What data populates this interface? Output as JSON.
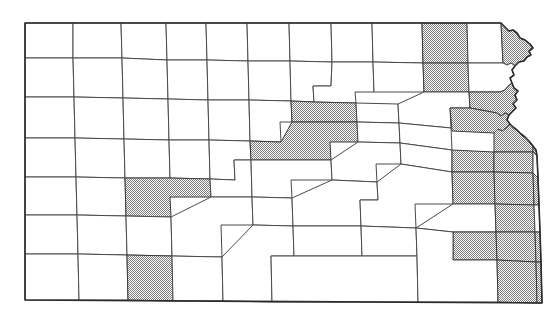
{
  "map": {
    "title": "Kansas county map",
    "type": "choropleth-outline",
    "region": "Kansas",
    "subdivision_type": "county",
    "background_color": "#ffffff",
    "outline_color": "#2b2b2b",
    "county_border_color": "#4a4a4a",
    "shaded_fill_color": "#a8a8a8",
    "unshaded_fill_color": "#ffffff",
    "shading_style": "halftone-dither",
    "legend_present": false,
    "labels_present": false,
    "shaded_count": 26,
    "total_count": 105,
    "counties": [
      {
        "id": "cheyenne",
        "row": 1,
        "col": 1,
        "shaded": false
      },
      {
        "id": "rawlins",
        "row": 1,
        "col": 2,
        "shaded": false
      },
      {
        "id": "decatur",
        "row": 1,
        "col": 3,
        "shaded": false
      },
      {
        "id": "norton",
        "row": 1,
        "col": 4,
        "shaded": false
      },
      {
        "id": "phillips",
        "row": 1,
        "col": 5,
        "shaded": false
      },
      {
        "id": "smith",
        "row": 1,
        "col": 6,
        "shaded": false
      },
      {
        "id": "jewell",
        "row": 1,
        "col": 7,
        "shaded": false
      },
      {
        "id": "republic",
        "row": 1,
        "col": 8,
        "shaded": false
      },
      {
        "id": "washington",
        "row": 1,
        "col": 9,
        "shaded": false
      },
      {
        "id": "marshall",
        "row": 1,
        "col": 10,
        "shaded": false
      },
      {
        "id": "nemaha",
        "row": 1,
        "col": 11,
        "shaded": true
      },
      {
        "id": "brown",
        "row": 1,
        "col": 12,
        "shaded": false
      },
      {
        "id": "doniphan",
        "row": 1,
        "col": 13,
        "shaded": true
      },
      {
        "id": "sherman",
        "row": 2,
        "col": 1,
        "shaded": false
      },
      {
        "id": "thomas",
        "row": 2,
        "col": 2,
        "shaded": false
      },
      {
        "id": "sheridan",
        "row": 2,
        "col": 3,
        "shaded": false
      },
      {
        "id": "graham",
        "row": 2,
        "col": 4,
        "shaded": false
      },
      {
        "id": "rooks",
        "row": 2,
        "col": 5,
        "shaded": false
      },
      {
        "id": "osborne",
        "row": 2,
        "col": 6,
        "shaded": false
      },
      {
        "id": "mitchell",
        "row": 2,
        "col": 7,
        "shaded": false
      },
      {
        "id": "cloud",
        "row": 2,
        "col": 8,
        "shaded": false
      },
      {
        "id": "clay",
        "row": 2,
        "col": 9,
        "shaded": true
      },
      {
        "id": "riley",
        "row": 2,
        "col": 10,
        "shaded": false
      },
      {
        "id": "pottawatomie",
        "row": 2,
        "col": 11,
        "shaded": false
      },
      {
        "id": "jackson",
        "row": 2,
        "col": 12,
        "shaded": false
      },
      {
        "id": "atchison",
        "row": 2,
        "col": 13,
        "shaded": true
      },
      {
        "id": "wallace",
        "row": 3,
        "col": 1,
        "shaded": false
      },
      {
        "id": "logan",
        "row": 3,
        "col": 2,
        "shaded": false
      },
      {
        "id": "gove",
        "row": 3,
        "col": 3,
        "shaded": false
      },
      {
        "id": "trego",
        "row": 3,
        "col": 4,
        "shaded": false
      },
      {
        "id": "ellis",
        "row": 3,
        "col": 5,
        "shaded": false
      },
      {
        "id": "russell",
        "row": 3,
        "col": 6,
        "shaded": false
      },
      {
        "id": "lincoln",
        "row": 3,
        "col": 7,
        "shaded": false
      },
      {
        "id": "ottawa",
        "row": 3,
        "col": 8,
        "shaded": false
      },
      {
        "id": "dickinson",
        "row": 3,
        "col": 9,
        "shaded": true
      },
      {
        "id": "geary",
        "row": 3,
        "col": 10,
        "shaded": false
      },
      {
        "id": "wabaunsee",
        "row": 3,
        "col": 11,
        "shaded": false
      },
      {
        "id": "shawnee",
        "row": 3,
        "col": 12,
        "shaded": true
      },
      {
        "id": "jefferson",
        "row": 3,
        "col": 13,
        "shaded": false
      },
      {
        "id": "leavenworth",
        "row": 3,
        "col": 14,
        "shaded": true
      },
      {
        "id": "greeley",
        "row": 4,
        "col": 1,
        "shaded": false
      },
      {
        "id": "wichita",
        "row": 4,
        "col": 2,
        "shaded": false
      },
      {
        "id": "scott",
        "row": 4,
        "col": 3,
        "shaded": false
      },
      {
        "id": "lane",
        "row": 4,
        "col": 4,
        "shaded": false
      },
      {
        "id": "ness",
        "row": 4,
        "col": 5,
        "shaded": false
      },
      {
        "id": "rush",
        "row": 4,
        "col": 6,
        "shaded": false
      },
      {
        "id": "barton",
        "row": 4,
        "col": 7,
        "shaded": false
      },
      {
        "id": "ellsworth",
        "row": 4,
        "col": 8,
        "shaded": false
      },
      {
        "id": "saline",
        "row": 4,
        "col": 9,
        "shaded": true
      },
      {
        "id": "morris",
        "row": 4,
        "col": 10,
        "shaded": false
      },
      {
        "id": "osage",
        "row": 4,
        "col": 11,
        "shaded": false
      },
      {
        "id": "douglas",
        "row": 4,
        "col": 12,
        "shaded": true
      },
      {
        "id": "johnson",
        "row": 4,
        "col": 13,
        "shaded": true
      },
      {
        "id": "hamilton",
        "row": 5,
        "col": 1,
        "shaded": false
      },
      {
        "id": "kearny",
        "row": 5,
        "col": 2,
        "shaded": false
      },
      {
        "id": "finney",
        "row": 5,
        "col": 3,
        "shaded": true
      },
      {
        "id": "hodgeman",
        "row": 5,
        "col": 4,
        "shaded": false
      },
      {
        "id": "pawnee",
        "row": 5,
        "col": 5,
        "shaded": false
      },
      {
        "id": "stafford",
        "row": 5,
        "col": 6,
        "shaded": false
      },
      {
        "id": "rice",
        "row": 5,
        "col": 7,
        "shaded": false
      },
      {
        "id": "mcpherson",
        "row": 5,
        "col": 8,
        "shaded": false
      },
      {
        "id": "marion",
        "row": 5,
        "col": 9,
        "shaded": false
      },
      {
        "id": "chase",
        "row": 5,
        "col": 10,
        "shaded": false
      },
      {
        "id": "lyon",
        "row": 5,
        "col": 11,
        "shaded": false
      },
      {
        "id": "franklin",
        "row": 5,
        "col": 12,
        "shaded": false
      },
      {
        "id": "miami",
        "row": 5,
        "col": 13,
        "shaded": true
      },
      {
        "id": "stanton",
        "row": 6,
        "col": 1,
        "shaded": false
      },
      {
        "id": "grant",
        "row": 6,
        "col": 2,
        "shaded": false
      },
      {
        "id": "haskell",
        "row": 6,
        "col": 3,
        "shaded": false
      },
      {
        "id": "gray",
        "row": 6,
        "col": 4,
        "shaded": false
      },
      {
        "id": "ford",
        "row": 6,
        "col": 5,
        "shaded": false
      },
      {
        "id": "edwards",
        "row": 6,
        "col": 6,
        "shaded": false
      },
      {
        "id": "pratt",
        "row": 6,
        "col": 7,
        "shaded": false
      },
      {
        "id": "reno",
        "row": 6,
        "col": 8,
        "shaded": true
      },
      {
        "id": "harvey",
        "row": 6,
        "col": 9,
        "shaded": false
      },
      {
        "id": "butler",
        "row": 6,
        "col": 10,
        "shaded": true
      },
      {
        "id": "greenwood",
        "row": 6,
        "col": 11,
        "shaded": false
      },
      {
        "id": "coffey",
        "row": 6,
        "col": 12,
        "shaded": false
      },
      {
        "id": "anderson",
        "row": 6,
        "col": 13,
        "shaded": false
      },
      {
        "id": "linn",
        "row": 6,
        "col": 14,
        "shaded": true
      },
      {
        "id": "morton",
        "row": 7,
        "col": 1,
        "shaded": false
      },
      {
        "id": "stevens",
        "row": 7,
        "col": 2,
        "shaded": false
      },
      {
        "id": "seward",
        "row": 7,
        "col": 3,
        "shaded": true
      },
      {
        "id": "meade",
        "row": 7,
        "col": 4,
        "shaded": false
      },
      {
        "id": "clark",
        "row": 7,
        "col": 5,
        "shaded": false
      },
      {
        "id": "kiowa",
        "row": 7,
        "col": 6,
        "shaded": false
      },
      {
        "id": "barber",
        "row": 7,
        "col": 7,
        "shaded": false
      },
      {
        "id": "harper",
        "row": 7,
        "col": 8,
        "shaded": false
      },
      {
        "id": "sumner",
        "row": 7,
        "col": 9,
        "shaded": false
      },
      {
        "id": "sedgwick",
        "row": 7,
        "col": 10,
        "shaded": true
      },
      {
        "id": "cowley",
        "row": 7,
        "col": 11,
        "shaded": true
      },
      {
        "id": "elk",
        "row": 7,
        "col": 12,
        "shaded": false
      },
      {
        "id": "woodson",
        "row": 7,
        "col": 13,
        "shaded": false
      },
      {
        "id": "allen",
        "row": 7,
        "col": 14,
        "shaded": false
      },
      {
        "id": "bourbon",
        "row": 7,
        "col": 15,
        "shaded": true
      },
      {
        "id": "comanche",
        "row": 8,
        "col": 1,
        "shaded": false
      },
      {
        "id": "chautauqua",
        "row": 8,
        "col": 2,
        "shaded": false
      },
      {
        "id": "montgomery",
        "row": 8,
        "col": 3,
        "shaded": true
      },
      {
        "id": "labette",
        "row": 8,
        "col": 4,
        "shaded": false
      },
      {
        "id": "cherokee",
        "row": 8,
        "col": 5,
        "shaded": true
      },
      {
        "id": "wilson",
        "row": 8,
        "col": 6,
        "shaded": false
      },
      {
        "id": "neosho",
        "row": 8,
        "col": 7,
        "shaded": false
      },
      {
        "id": "crawford",
        "row": 8,
        "col": 8,
        "shaded": true
      },
      {
        "id": "nw-extra",
        "row": 9,
        "col": 1,
        "shaded": false
      },
      {
        "id": "sw-extra",
        "row": 9,
        "col": 2,
        "shaded": false
      }
    ]
  }
}
